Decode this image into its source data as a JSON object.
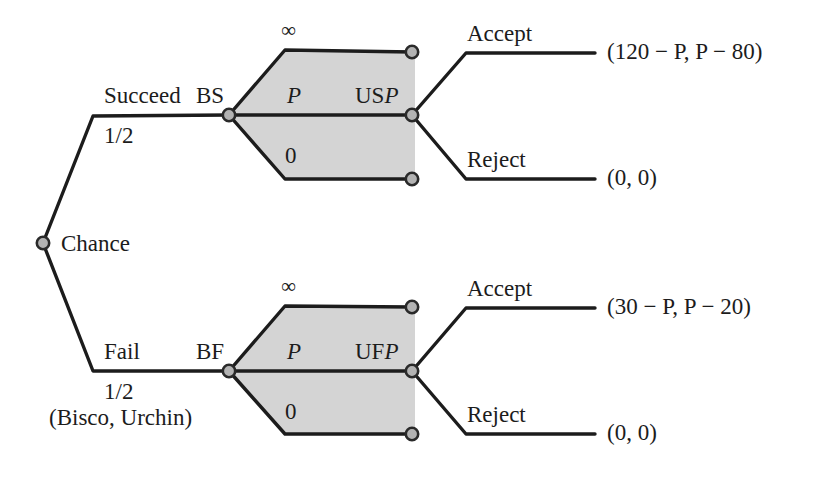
{
  "diagram": {
    "type": "extensive-form-game-tree",
    "players_label": "(Bisco, Urchin)",
    "root": {
      "node_label": "Chance",
      "node_kind": "chance-node"
    },
    "chance_branches": [
      {
        "action": "Succeed",
        "probability": "1/2",
        "decision_node_label": "BS",
        "info_set_label_prefix": "US",
        "info_set_label_var": "P",
        "continuum_top": "∞",
        "continuum_mid": "P",
        "continuum_bottom": "0",
        "responses": [
          {
            "action": "Accept",
            "payoff": "(120 − P, P − 80)"
          },
          {
            "action": "Reject",
            "payoff": "(0, 0)"
          }
        ]
      },
      {
        "action": "Fail",
        "probability": "1/2",
        "decision_node_label": "BF",
        "info_set_label_prefix": "UF",
        "info_set_label_var": "P",
        "continuum_top": "∞",
        "continuum_mid": "P",
        "continuum_bottom": "0",
        "responses": [
          {
            "action": "Accept",
            "payoff": "(30 − P, P − 20)"
          },
          {
            "action": "Reject",
            "payoff": "(0, 0)"
          }
        ]
      }
    ],
    "colors": {
      "line": "#1c1c1c",
      "info_set_fill": "#d4d4d4",
      "node_fill": "#b3b3b3",
      "node_stroke": "#2a2a2a",
      "background": "#ffffff",
      "text": "#1c1c1c"
    }
  }
}
